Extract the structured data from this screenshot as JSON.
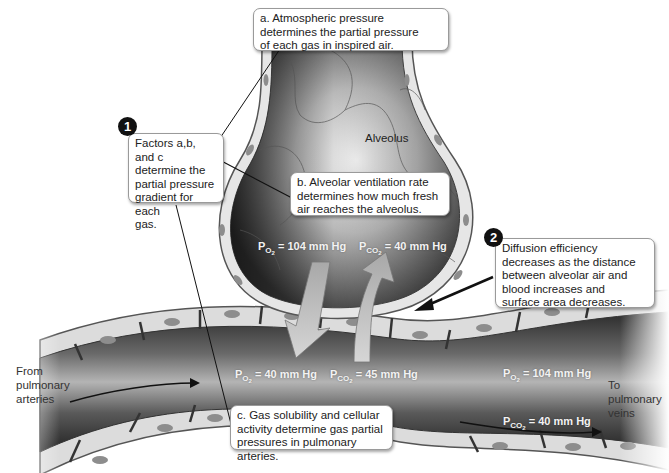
{
  "diagram": {
    "structures": {
      "alveolus": "Alveolus",
      "capillary": "Pulmonary capillary"
    },
    "callouts": {
      "a": {
        "lines": [
          "a. Atmospheric pressure",
          "determines the partial pressure",
          "of each gas in inspired air."
        ]
      },
      "b": {
        "lines": [
          "b. Alveolar ventilation rate",
          "determines how much fresh",
          "air reaches the alveolus."
        ]
      },
      "c": {
        "lines": [
          "c. Gas solubility and cellular",
          "activity determine gas partial",
          "pressures in pulmonary arteries."
        ]
      },
      "factors": {
        "badge": "1",
        "lines": [
          "Factors a,b, and c",
          "determine the",
          "partial pressure",
          "gradient for each",
          "gas."
        ]
      },
      "diffusion": {
        "badge": "2",
        "lines": [
          "Diffusion efficiency",
          "decreases as the distance",
          "between alveolar air and",
          "blood increases and",
          "surface area decreases."
        ]
      }
    },
    "pressures": {
      "alveolar_po2": {
        "p": "P",
        "sub": "O",
        "subsub": "2",
        "value": "= 104 mm Hg"
      },
      "alveolar_pco2": {
        "p": "P",
        "sub": "CO",
        "subsub": "2",
        "value": "= 40 mm Hg"
      },
      "arterial_po2": {
        "p": "P",
        "sub": "O",
        "subsub": "2",
        "value": "= 40 mm Hg"
      },
      "arterial_pco2": {
        "p": "P",
        "sub": "CO",
        "subsub": "2",
        "value": "= 45 mm Hg"
      },
      "venous_po2": {
        "p": "P",
        "sub": "O",
        "subsub": "2",
        "value": "= 104 mm Hg"
      },
      "venous_pco2": {
        "p": "P",
        "sub": "CO",
        "subsub": "2",
        "value": "= 40 mm Hg"
      }
    },
    "flow_labels": {
      "from": [
        "From",
        "pulmonary",
        "arteries"
      ],
      "to": [
        "To",
        "pulmonary",
        "veins"
      ]
    },
    "colors": {
      "vessel_dark": "#2a2a2a",
      "vessel_light": "#bdbdbd",
      "cell_wall": "#e8e8e8",
      "nucleus": "#8a8a8a",
      "arrow_fill": "#c4c4c4",
      "callout_border": "#9a9a9a"
    }
  }
}
